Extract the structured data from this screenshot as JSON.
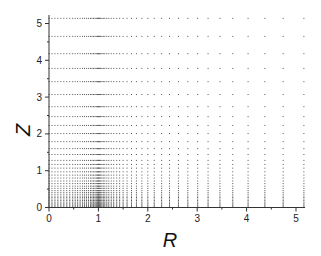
{
  "chart_data": {
    "type": "scatter",
    "title": "",
    "xlabel": "R",
    "ylabel": "Z",
    "xlim": [
      0,
      5.15
    ],
    "ylim": [
      0,
      5.15
    ],
    "grid": false,
    "legend": null,
    "x_ticks": [
      "0",
      "1",
      "2",
      "3",
      "4",
      "5"
    ],
    "y_ticks": [
      "0",
      "1",
      "2",
      "3",
      "4",
      "5"
    ],
    "point_color": "#555555",
    "r_columns": [
      0.0,
      0.06,
      0.12,
      0.18,
      0.24,
      0.3,
      0.36,
      0.42,
      0.48,
      0.53,
      0.58,
      0.63,
      0.68,
      0.72,
      0.76,
      0.8,
      0.84,
      0.87,
      0.9,
      0.93,
      0.955,
      0.975,
      0.99,
      1.0,
      1.01,
      1.025,
      1.045,
      1.07,
      1.1,
      1.13,
      1.17,
      1.21,
      1.26,
      1.31,
      1.37,
      1.43,
      1.5,
      1.58,
      1.67,
      1.77,
      1.88,
      2.0,
      2.13,
      2.28,
      2.44,
      2.62,
      2.81,
      3.01,
      3.22,
      3.46,
      3.72,
      4.03,
      4.37,
      4.74,
      5.16
    ],
    "z_rows": [
      0.0,
      0.03,
      0.06,
      0.09,
      0.12,
      0.15,
      0.19,
      0.23,
      0.27,
      0.31,
      0.36,
      0.41,
      0.46,
      0.52,
      0.58,
      0.65,
      0.72,
      0.8,
      0.88,
      0.97,
      1.07,
      1.17,
      1.28,
      1.44,
      1.6,
      1.79,
      2.01,
      2.23,
      2.47,
      2.74,
      3.07,
      3.42,
      3.78,
      4.18,
      4.65,
      5.14
    ]
  }
}
